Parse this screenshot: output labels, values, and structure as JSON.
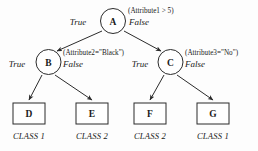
{
  "diagram": {
    "type": "decision-tree",
    "title": "",
    "background_color": "#fdfdfd",
    "line_color": "#2b2b2b",
    "nodes": {
      "root": {
        "id": "A",
        "label": "A",
        "shape": "circle",
        "test": "(Attribute1 > 5)",
        "true_label": "True",
        "false_label": "False"
      },
      "left": {
        "id": "B",
        "label": "B",
        "shape": "circle",
        "test": "(Attribute2=\"Black\")",
        "true_label": "True",
        "false_label": "False"
      },
      "right": {
        "id": "C",
        "label": "C",
        "shape": "circle",
        "test": "(Attribute3=\"No\")",
        "true_label": "True",
        "false_label": "False"
      }
    },
    "leaves": [
      {
        "id": "D",
        "label": "D",
        "shape": "rect",
        "class": "CLASS 1"
      },
      {
        "id": "E",
        "label": "E",
        "shape": "rect",
        "class": "CLASS 2"
      },
      {
        "id": "F",
        "label": "F",
        "shape": "rect",
        "class": "CLASS 2"
      },
      {
        "id": "G",
        "label": "G",
        "shape": "rect",
        "class": "CLASS 1"
      }
    ]
  }
}
